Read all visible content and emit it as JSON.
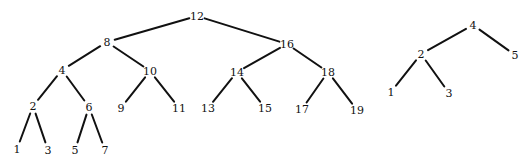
{
  "trees": [
    {
      "name": "left-bst",
      "nodes": [
        {
          "id": "n12",
          "label": "12",
          "x": 197,
          "y": 16
        },
        {
          "id": "n8",
          "label": "8",
          "x": 107,
          "y": 42
        },
        {
          "id": "n16",
          "label": "16",
          "x": 287,
          "y": 44
        },
        {
          "id": "n4",
          "label": "4",
          "x": 62,
          "y": 70
        },
        {
          "id": "n10",
          "label": "10",
          "x": 150,
          "y": 71
        },
        {
          "id": "n14",
          "label": "14",
          "x": 237,
          "y": 72
        },
        {
          "id": "n18",
          "label": "18",
          "x": 328,
          "y": 72
        },
        {
          "id": "n2",
          "label": "2",
          "x": 33,
          "y": 106
        },
        {
          "id": "n6",
          "label": "6",
          "x": 89,
          "y": 107
        },
        {
          "id": "n9",
          "label": "9",
          "x": 121,
          "y": 108
        },
        {
          "id": "n11",
          "label": "11",
          "x": 179,
          "y": 108
        },
        {
          "id": "n13",
          "label": "13",
          "x": 208,
          "y": 108
        },
        {
          "id": "n15",
          "label": "15",
          "x": 265,
          "y": 108
        },
        {
          "id": "n17",
          "label": "17",
          "x": 302,
          "y": 109
        },
        {
          "id": "n19",
          "label": "19",
          "x": 357,
          "y": 110
        },
        {
          "id": "n1",
          "label": "1",
          "x": 17,
          "y": 149
        },
        {
          "id": "n3",
          "label": "3",
          "x": 48,
          "y": 150
        },
        {
          "id": "n5",
          "label": "5",
          "x": 75,
          "y": 150
        },
        {
          "id": "n7",
          "label": "7",
          "x": 105,
          "y": 150
        }
      ],
      "edges": [
        [
          "n12",
          "n8"
        ],
        [
          "n12",
          "n16"
        ],
        [
          "n8",
          "n4"
        ],
        [
          "n8",
          "n10"
        ],
        [
          "n16",
          "n14"
        ],
        [
          "n16",
          "n18"
        ],
        [
          "n4",
          "n2"
        ],
        [
          "n4",
          "n6"
        ],
        [
          "n10",
          "n9"
        ],
        [
          "n10",
          "n11"
        ],
        [
          "n14",
          "n13"
        ],
        [
          "n14",
          "n15"
        ],
        [
          "n18",
          "n17"
        ],
        [
          "n18",
          "n19"
        ],
        [
          "n2",
          "n1"
        ],
        [
          "n2",
          "n3"
        ],
        [
          "n6",
          "n5"
        ],
        [
          "n6",
          "n7"
        ]
      ]
    },
    {
      "name": "right-bst",
      "nodes": [
        {
          "id": "r4",
          "label": "4",
          "x": 473,
          "y": 25
        },
        {
          "id": "r2",
          "label": "2",
          "x": 421,
          "y": 54
        },
        {
          "id": "r5",
          "label": "5",
          "x": 515,
          "y": 55
        },
        {
          "id": "r1",
          "label": "1",
          "x": 391,
          "y": 92
        },
        {
          "id": "r3",
          "label": "3",
          "x": 449,
          "y": 93
        }
      ],
      "edges": [
        [
          "r4",
          "r2"
        ],
        [
          "r4",
          "r5"
        ],
        [
          "r2",
          "r1"
        ],
        [
          "r2",
          "r3"
        ]
      ]
    }
  ],
  "colors": {
    "line": "#111111",
    "text": "#111111",
    "background": "#ffffff"
  }
}
